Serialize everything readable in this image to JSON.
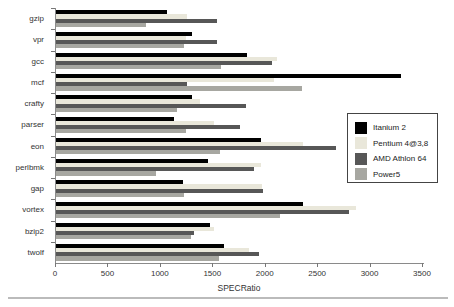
{
  "chart_data": {
    "type": "bar",
    "orientation": "horizontal",
    "title": "",
    "xlabel": "SPECRatio",
    "ylabel": "",
    "xlim": [
      0,
      3500
    ],
    "xticks": [
      0,
      500,
      1000,
      1500,
      2000,
      2500,
      3000,
      3500
    ],
    "grid": false,
    "legend_position": "right",
    "categories": [
      "gzip",
      "vpr",
      "gcc",
      "mcf",
      "crafty",
      "parser",
      "eon",
      "perlbmk",
      "gap",
      "vortex",
      "bzip2",
      "twolf"
    ],
    "series": [
      {
        "name": "Itanium 2",
        "color": "#000000",
        "values": [
          1055,
          1300,
          1820,
          3290,
          1300,
          1125,
          1955,
          1445,
          1215,
          2355,
          1465,
          1600
        ]
      },
      {
        "name": "Pentium 4@3,8",
        "color": "#e9e7da",
        "values": [
          1245,
          1240,
          2105,
          2075,
          1370,
          1505,
          2360,
          1955,
          1965,
          2865,
          1505,
          1840
        ]
      },
      {
        "name": "AMD Athlon 64",
        "color": "#575757",
        "values": [
          1535,
          1535,
          2060,
          1250,
          1815,
          1750,
          2675,
          1885,
          1975,
          2790,
          1315,
          1940
        ]
      },
      {
        "name": "Power5",
        "color": "#a7a7a1",
        "values": [
          860,
          1225,
          1570,
          2350,
          1155,
          1240,
          1560,
          955,
          1220,
          2140,
          1285,
          1550
        ]
      }
    ]
  }
}
